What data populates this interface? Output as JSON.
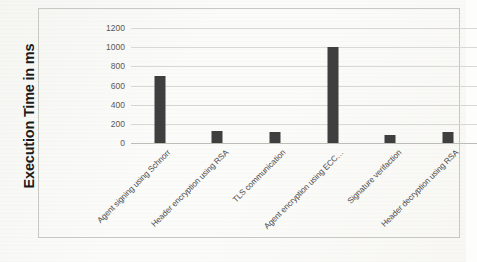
{
  "chart_data": {
    "type": "bar",
    "title": "",
    "xlabel": "",
    "ylabel": "Execution Time in ms",
    "ylim": [
      0,
      1200
    ],
    "ytick_step": 200,
    "yticks": [
      "1200",
      "1000",
      "800",
      "600",
      "400",
      "200",
      "0"
    ],
    "grid": true,
    "legend": "none",
    "bar_color": "#3f3f3f",
    "gridline_color": "#d8d8d4",
    "categories": [
      "Agent signing using Schnorr",
      "Header encryption  using RSA",
      "TLS communication",
      "Agent encryption using ECC…",
      "Signature verifaction",
      "Header decryption using RSA"
    ],
    "values": [
      700,
      125,
      120,
      1000,
      85,
      120
    ]
  }
}
